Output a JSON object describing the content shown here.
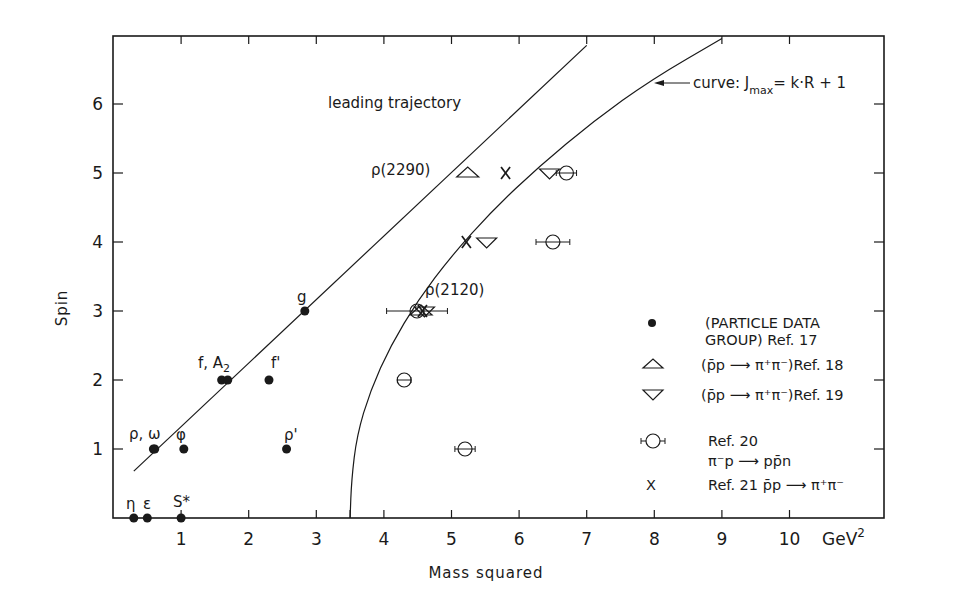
{
  "chart_data": {
    "type": "scatter",
    "title": "",
    "xlabel": "Mass squared",
    "xunit": "GeV²",
    "ylabel": "Spin",
    "xlim": [
      0,
      11.4
    ],
    "ylim": [
      0,
      7
    ],
    "x_ticks": [
      1,
      2,
      3,
      4,
      5,
      6,
      7,
      8,
      9,
      10
    ],
    "y_ticks": [
      1,
      2,
      3,
      4,
      5,
      6
    ],
    "grid": false,
    "legend_position": "lower right inside",
    "series": [
      {
        "name": "(PARTICLE DATA GROUP) Ref. 17",
        "marker": "filled-circle",
        "points": [
          {
            "x": 0.3,
            "y": 0,
            "label": "η"
          },
          {
            "x": 0.5,
            "y": 0,
            "label": "ε"
          },
          {
            "x": 1.0,
            "y": 0,
            "label": "S*"
          },
          {
            "x": 0.59,
            "y": 1,
            "label": "ρ,ω"
          },
          {
            "x": 0.61,
            "y": 1,
            "label": ""
          },
          {
            "x": 1.04,
            "y": 1,
            "label": "φ"
          },
          {
            "x": 2.56,
            "y": 1,
            "label": "ρ'"
          },
          {
            "x": 1.6,
            "y": 2,
            "label": "f,A₂"
          },
          {
            "x": 1.69,
            "y": 2,
            "label": ""
          },
          {
            "x": 2.3,
            "y": 2,
            "label": "f'"
          },
          {
            "x": 2.83,
            "y": 3,
            "label": "g"
          }
        ]
      },
      {
        "name": "(p̄p → π⁺π⁻) Ref. 18",
        "marker": "open-triangle-up",
        "points": [
          {
            "x": 5.24,
            "y": 5,
            "label": "ρ(2290)"
          },
          {
            "x": 4.55,
            "y": 3,
            "label": ""
          }
        ]
      },
      {
        "name": "(p̄p → π⁺π⁻) Ref. 19",
        "marker": "open-triangle-down",
        "points": [
          {
            "x": 5.52,
            "y": 4,
            "label": ""
          },
          {
            "x": 6.45,
            "y": 5,
            "label": ""
          },
          {
            "x": 4.6,
            "y": 3,
            "label": ""
          }
        ]
      },
      {
        "name": "Ref. 20 π⁻p → pp̄n",
        "marker": "open-circle-with-xerr",
        "points": [
          {
            "x": 6.7,
            "y": 5,
            "xerr": 0.15
          },
          {
            "x": 6.5,
            "y": 4,
            "xerr": 0.25
          },
          {
            "x": 4.49,
            "y": 3,
            "xerr": 0.45,
            "label": "ρ(2120)"
          },
          {
            "x": 4.3,
            "y": 2,
            "xerr": 0.1
          },
          {
            "x": 5.2,
            "y": 1,
            "xerr": 0.15
          }
        ]
      },
      {
        "name": "Ref. 21 p̄p → π⁺π⁻",
        "marker": "x",
        "points": [
          {
            "x": 5.8,
            "y": 5
          },
          {
            "x": 5.22,
            "y": 4
          },
          {
            "x": 4.57,
            "y": 3
          }
        ]
      }
    ],
    "curves": [
      {
        "name": "leading trajectory",
        "type": "line",
        "points": [
          [
            0.3,
            0.68
          ],
          [
            7.0,
            6.85
          ]
        ]
      },
      {
        "name": "curve: J_max = k·R + 1",
        "type": "curve",
        "points": [
          [
            3.5,
            0.0
          ],
          [
            3.52,
            0.55
          ],
          [
            3.6,
            1.2
          ],
          [
            3.8,
            1.85
          ],
          [
            4.1,
            2.5
          ],
          [
            4.5,
            3.15
          ],
          [
            5.0,
            3.8
          ],
          [
            5.6,
            4.45
          ],
          [
            6.3,
            5.1
          ],
          [
            7.1,
            5.75
          ],
          [
            7.95,
            6.35
          ],
          [
            9.0,
            6.95
          ]
        ]
      }
    ],
    "annotations": [
      {
        "text": "leading trajectory",
        "x": 3.2,
        "y": 6.05
      },
      {
        "text": "curve: J_max = k·R + 1",
        "arrow_to": [
          7.75,
          6.3
        ]
      }
    ]
  },
  "axes": {
    "y_title": "Spin",
    "x_title": "Mass squared",
    "x_unit_base": "GeV",
    "x_unit_exp": "2",
    "x_tick_labels": [
      "1",
      "2",
      "3",
      "4",
      "5",
      "6",
      "7",
      "8",
      "9",
      "10"
    ],
    "y_tick_labels": [
      "1",
      "2",
      "3",
      "4",
      "5",
      "6"
    ]
  },
  "annotations": {
    "leading": "leading trajectory",
    "curve_prefix": "curve: J",
    "curve_sub": "max",
    "curve_suffix": "=  k·R + 1"
  },
  "point_labels": {
    "eta": "η",
    "epsilon": "ε",
    "s_star": "S*",
    "rho_omega": "ρ, ω",
    "phi": "φ",
    "rho_prime": "ρ'",
    "f_a2": "f, A",
    "f_a2_sub": "2",
    "f_prime": "f'",
    "g": "g",
    "rho2290": "ρ(2290)",
    "rho2120": "ρ(2120)"
  },
  "legend": {
    "items": [
      {
        "marker": "filled-circle",
        "line1": "(PARTICLE DATA",
        "line2": "GROUP) Ref. 17"
      },
      {
        "marker": "open-triangle-up",
        "line1": "(p̄p ⟶ π⁺π⁻)Ref. 18"
      },
      {
        "marker": "open-triangle-down",
        "line1": "(p̄p ⟶ π⁺π⁻)Ref. 19"
      },
      {
        "marker": "open-circle-with-xerr",
        "line1": "Ref. 20",
        "line2": "π⁻p ⟶ pp̄n"
      },
      {
        "marker": "x",
        "marker_text": "X",
        "line1": "Ref. 21  p̄p ⟶ π⁺π⁻"
      }
    ]
  },
  "colors": {
    "ink": "#1a1a1a",
    "background": "#ffffff"
  }
}
